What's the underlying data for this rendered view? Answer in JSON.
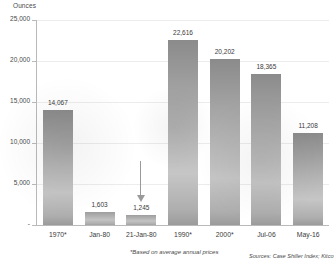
{
  "chart_data": {
    "type": "bar",
    "title": "",
    "xlabel": "",
    "ylabel": "Ounces",
    "ylim": [
      0,
      25000
    ],
    "ytick_labels": [
      "-",
      "5,000",
      "10,000",
      "15,000",
      "20,000",
      "25,000"
    ],
    "ytick_values": [
      0,
      5000,
      10000,
      15000,
      20000,
      25000
    ],
    "grid": true,
    "legend": "none",
    "categories": [
      "1970*",
      "Jan-80",
      "21-Jan-80",
      "1990*",
      "2000*",
      "Jul-06",
      "May-16"
    ],
    "values": [
      14067,
      1603,
      1245,
      22616,
      20202,
      18365,
      11208
    ],
    "value_labels": [
      "14,067",
      "1,603",
      "1,245",
      "22,616",
      "20,202",
      "18,365",
      "11,208"
    ],
    "annotations": [
      {
        "name": "down-arrow",
        "target_category": "21-Jan-80",
        "direction": "down"
      }
    ],
    "footnote": "*Based on average annual prices",
    "sources": "Sources: Case Shiller Index; Kitco",
    "bar_color": "#b4b4b4",
    "grid_color": "#ececed",
    "axis_color": "#b9b9b9",
    "text_color": "#3a3a3a"
  }
}
